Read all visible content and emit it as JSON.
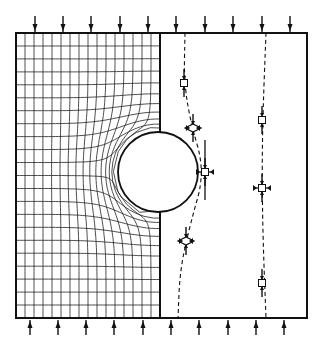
{
  "diagram": {
    "type": "stress-analysis-plate-with-circular-hole",
    "frame": {
      "left": 16,
      "top": 33,
      "right": 307,
      "bottom": 318
    },
    "hole": {
      "cx": 158,
      "cy": 172,
      "r": 40
    },
    "centerline_x": 160,
    "left_half": {
      "content": "distorted-grid-mesh",
      "rows": 22,
      "cols": 16
    },
    "right_half": {
      "content": "stress-trajectories",
      "trajectories": [
        {
          "name": "near-hole-trajectory",
          "points": [
            [
              185,
              33
            ],
            [
              184,
              80
            ],
            [
              190,
              120
            ],
            [
              205,
              172
            ],
            [
              190,
              225
            ],
            [
              180,
              270
            ],
            [
              178,
              318
            ]
          ]
        },
        {
          "name": "far-trajectory",
          "points": [
            [
              266,
              33
            ],
            [
              263,
              110
            ],
            [
              262,
              172
            ],
            [
              263,
              240
            ],
            [
              266,
              318
            ]
          ]
        }
      ],
      "stress_elements": [
        {
          "name": "element-upper-near",
          "x": 184,
          "y": 83,
          "shape": "square"
        },
        {
          "name": "element-upper-diag",
          "x": 193,
          "y": 128,
          "shape": "rotated"
        },
        {
          "name": "element-hole-edge",
          "x": 205,
          "y": 172,
          "shape": "square-with-arrows"
        },
        {
          "name": "element-lower-diag",
          "x": 186,
          "y": 241,
          "shape": "rotated"
        },
        {
          "name": "element-far-upper",
          "x": 262,
          "y": 120,
          "shape": "square"
        },
        {
          "name": "element-far-mid",
          "x": 262,
          "y": 188,
          "shape": "square-with-arrows"
        },
        {
          "name": "element-far-lower",
          "x": 262,
          "y": 283,
          "shape": "square"
        }
      ]
    },
    "loads": {
      "top_arrows_x": [
        35,
        63,
        91,
        120,
        148,
        176,
        205,
        233,
        262,
        290
      ],
      "bottom_arrows_x": [
        30,
        58,
        86,
        114,
        143,
        171,
        199,
        228,
        256,
        284
      ],
      "direction": "compression"
    },
    "colors": {
      "line": "#111111",
      "background": "#ffffff"
    }
  }
}
